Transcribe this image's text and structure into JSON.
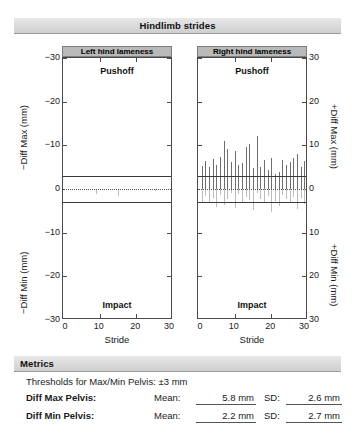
{
  "header": {
    "title": "Hindlimb strides"
  },
  "metrics_section": {
    "title": "Metrics",
    "threshold_text": "Thresholds for Max/Min Pelvis: ±3 mm",
    "rows": [
      {
        "name": "Diff Max Pelvis:",
        "mean_label": "Mean:",
        "mean_value": "5.8 mm",
        "sd_label": "SD:",
        "sd_value": "2.6 mm"
      },
      {
        "name": "Diff Min Pelvis:",
        "mean_label": "Mean:",
        "mean_value": "2.2 mm",
        "sd_label": "SD:",
        "sd_value": "2.7 mm"
      }
    ]
  },
  "axes": {
    "y_left_tick_labels": [
      "−30",
      "−20",
      "−10",
      "0",
      "−10",
      "−20",
      "−30"
    ],
    "y_right_tick_labels": [
      "30",
      "20",
      "10",
      "0",
      "10",
      "20",
      "30"
    ],
    "x_tick_labels": [
      "0",
      "10",
      "20",
      "30"
    ],
    "y_left_title_top": "−Diff Max (mm)",
    "y_left_title_bottom": "−Diff Min (mm)",
    "y_right_title_top": "+Diff Max (mm)",
    "y_right_title_bottom": "+Diff Min (mm)",
    "x_title": "Stride",
    "phase_top": "Pushoff",
    "phase_bottom": "Impact"
  },
  "chart_data": [
    {
      "type": "bar",
      "id": "left-hind-lameness",
      "title": "Left hind lameness",
      "xlabel": "Stride",
      "ylabel_upper": "−Diff Max (mm)",
      "ylabel_lower": "−Diff Min (mm)",
      "xlim": [
        0,
        30
      ],
      "ylim_upper": [
        0,
        30
      ],
      "ylim_lower": [
        0,
        30
      ],
      "grid": false,
      "threshold": 3,
      "annotations": [
        "Pushoff",
        "Impact"
      ],
      "x": [
        1,
        2,
        3,
        4,
        5,
        6,
        7,
        8,
        9,
        10,
        11,
        12,
        13,
        14,
        15,
        16,
        17,
        18,
        19,
        20,
        21,
        22,
        23,
        24,
        25,
        26,
        27,
        28,
        29
      ],
      "series": [
        {
          "name": "Diff Max",
          "values": [
            0,
            0,
            0,
            0,
            0,
            0,
            0,
            0,
            0,
            0,
            0,
            0,
            0,
            0,
            0,
            0,
            0,
            0,
            0,
            0,
            0,
            0,
            0,
            0,
            0,
            0,
            0,
            0,
            0
          ]
        },
        {
          "name": "Diff Min",
          "values": [
            0,
            0,
            0,
            0,
            0,
            0,
            0,
            0,
            1.1,
            0,
            0,
            0,
            0,
            0,
            1.6,
            0,
            0,
            0,
            0,
            0,
            0,
            0,
            0,
            0,
            0.5,
            0,
            0,
            0,
            0
          ]
        }
      ]
    },
    {
      "type": "bar",
      "id": "right-hind-lameness",
      "title": "Right hind lameness",
      "xlabel": "Stride",
      "ylabel_upper": "+Diff Max (mm)",
      "ylabel_lower": "+Diff Min (mm)",
      "xlim": [
        0,
        30
      ],
      "ylim_upper": [
        0,
        30
      ],
      "ylim_lower": [
        0,
        30
      ],
      "grid": false,
      "threshold": 3,
      "annotations": [
        "Pushoff",
        "Impact"
      ],
      "x": [
        1,
        2,
        3,
        4,
        5,
        6,
        7,
        8,
        9,
        10,
        11,
        12,
        13,
        14,
        15,
        16,
        17,
        18,
        19,
        20,
        21,
        22,
        23,
        24,
        25,
        26,
        27,
        28,
        29
      ],
      "series": [
        {
          "name": "Diff Max",
          "values": [
            5.2,
            6.4,
            5.0,
            6.8,
            5.6,
            7.4,
            11.0,
            9.2,
            6.2,
            8.6,
            5.4,
            6.0,
            9.6,
            10.2,
            4.8,
            12.2,
            5.0,
            6.6,
            4.4,
            7.0,
            3.4,
            4.0,
            6.6,
            5.6,
            6.2,
            7.2,
            8.0,
            5.0,
            6.4
          ]
        },
        {
          "name": "Diff Min",
          "values": [
            3.2,
            1.6,
            3.0,
            2.0,
            4.2,
            1.4,
            3.6,
            2.2,
            0.9,
            4.4,
            1.2,
            3.0,
            1.8,
            2.6,
            4.8,
            1.0,
            2.4,
            3.2,
            1.6,
            5.2,
            2.8,
            4.0,
            1.4,
            2.2,
            3.0,
            1.8,
            4.6,
            2.0,
            3.4
          ]
        }
      ]
    }
  ]
}
